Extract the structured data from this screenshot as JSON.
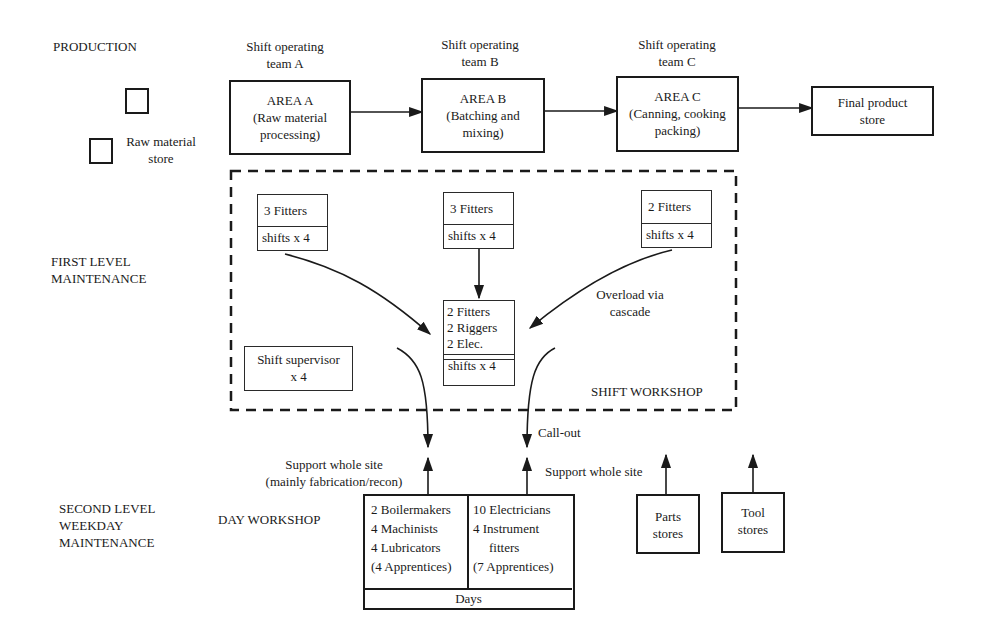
{
  "levels": {
    "production": "PRODUCTION",
    "first_level": [
      "FIRST LEVEL",
      "MAINTENANCE"
    ],
    "second_level": [
      "SECOND LEVEL",
      "WEEKDAY",
      "MAINTENANCE"
    ]
  },
  "production": {
    "raw_material_store": [
      "Raw material",
      "store"
    ],
    "teams": [
      {
        "label": [
          "Shift operating",
          "team A"
        ],
        "area": [
          "AREA A",
          "(Raw material",
          "processing)"
        ]
      },
      {
        "label": [
          "Shift operating",
          "team B"
        ],
        "area": [
          "AREA B",
          "(Batching and",
          "mixing)"
        ]
      },
      {
        "label": [
          "Shift operating",
          "team C"
        ],
        "area": [
          "AREA C",
          "(Canning, cooking",
          "packing)"
        ]
      }
    ],
    "final_store": [
      "Final product",
      "store"
    ]
  },
  "shift_workshop": {
    "title": "SHIFT WORKSHOP",
    "area_crews": [
      {
        "crew": "3 Fitters",
        "shifts": "shifts x 4"
      },
      {
        "crew": "3 Fitters",
        "shifts": "shifts x 4"
      },
      {
        "crew": "2 Fitters",
        "shifts": "shifts x 4"
      }
    ],
    "central_crew": {
      "lines": [
        "2 Fitters",
        "2 Riggers",
        "2 Elec."
      ],
      "shifts": "shifts x 4"
    },
    "supervisor": [
      "Shift supervisor",
      "x 4"
    ],
    "overload_note": [
      "Overload via",
      "cascade"
    ]
  },
  "day_workshop": {
    "title": "DAY WORKSHOP",
    "support_note": [
      "Support whole site",
      "(mainly fabrication/recon)"
    ],
    "callout_note": "Call-out",
    "support_whole_site": "Support whole site",
    "mechanical": [
      "2 Boilermakers",
      "4 Machinists",
      "4 Lubricators",
      "(4 Apprentices)"
    ],
    "electrical": [
      "10 Electricians",
      "4 Instrument",
      "fitters",
      "(7 Apprentices)"
    ],
    "days": "Days"
  },
  "stores": {
    "parts": [
      "Parts",
      "stores"
    ],
    "tool": [
      "Tool",
      "stores"
    ]
  },
  "colors": {
    "ink": "#1a1a1a",
    "background": "#ffffff"
  }
}
